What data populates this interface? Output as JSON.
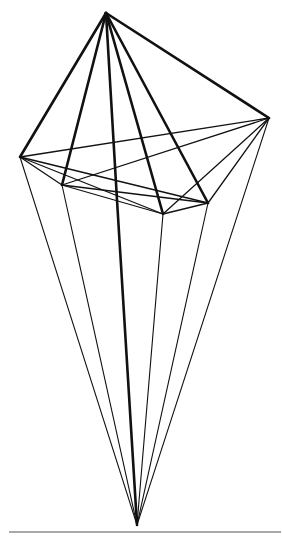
{
  "figure": {
    "colors": {
      "stroke": "#111111",
      "divider": "#a9a9a9",
      "background": "#ffffff"
    },
    "vertices": {
      "apex": [
        106,
        13
      ],
      "A": [
        20,
        157
      ],
      "B": [
        62,
        185
      ],
      "C": [
        163,
        214
      ],
      "D": [
        208,
        203
      ],
      "E": [
        269,
        118
      ],
      "bottom": [
        137,
        525
      ]
    },
    "upper_edges": [
      [
        "apex",
        "A"
      ],
      [
        "apex",
        "B"
      ],
      [
        "apex",
        "C"
      ],
      [
        "apex",
        "D"
      ],
      [
        "apex",
        "E"
      ]
    ],
    "central_axis": [
      [
        106,
        13
      ],
      [
        117,
        200
      ],
      [
        137,
        525
      ]
    ],
    "band_edges": [
      [
        "A",
        "B"
      ],
      [
        "A",
        "C"
      ],
      [
        "A",
        "D"
      ],
      [
        "A",
        "E"
      ],
      [
        "B",
        "C"
      ],
      [
        "B",
        "D"
      ],
      [
        "B",
        "E"
      ],
      [
        "C",
        "D"
      ],
      [
        "C",
        "E"
      ],
      [
        "D",
        "E"
      ]
    ],
    "lower_edges": [
      [
        "A",
        "bottom"
      ],
      [
        "B",
        "bottom"
      ],
      [
        "C",
        "bottom"
      ],
      [
        "D",
        "bottom"
      ],
      [
        "E",
        "bottom"
      ]
    ]
  },
  "caption": {
    "text": ""
  }
}
